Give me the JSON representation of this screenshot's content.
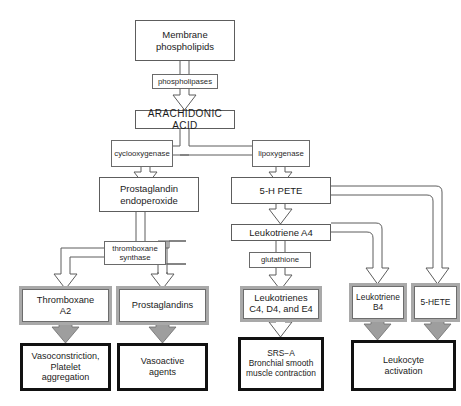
{
  "diagram": {
    "colors": {
      "line": "#5d5d5d",
      "gray_frame": "#a9a9a9",
      "gray_arrow_fill": "#9e9e9e",
      "heavy_border": "#111111",
      "text": "#1b1b1b",
      "background": "#ffffff"
    },
    "nodes": {
      "membrane_phospholipids": {
        "label": "Membrane\nphospholipids",
        "line1": "Membrane",
        "line2": "phospholipids",
        "style": "plain"
      },
      "phospholipases": {
        "label": "phospholipases",
        "style": "enzyme"
      },
      "arachidonic_acid": {
        "label": "ARACHIDONIC  ACID",
        "style": "plain"
      },
      "cyclooxygenase": {
        "label": "cyclooxygenase",
        "style": "enzyme"
      },
      "lipoxygenase": {
        "label": "lipoxygenase",
        "style": "enzyme"
      },
      "prostaglandin_endoperoxide": {
        "line1": "Prostaglandin",
        "line2": "endoperoxide",
        "style": "plain"
      },
      "five_h_pete": {
        "label": "5-H  PETE",
        "style": "plain"
      },
      "leukotriene_a4": {
        "label": "Leukotriene  A4",
        "style": "plain"
      },
      "thromboxane_synthase": {
        "line1": "thromboxane",
        "line2": "synthase",
        "style": "enzyme"
      },
      "glutathione": {
        "label": "glutathione",
        "style": "enzyme"
      },
      "thromboxane_a2": {
        "line1": "Thromboxane",
        "line2": "A2",
        "style": "gray"
      },
      "prostaglandins": {
        "label": "Prostaglandins",
        "style": "gray"
      },
      "leukotrienes_cde": {
        "line1": "Leukotrienes",
        "line2": "C4, D4, and E4",
        "style": "gray"
      },
      "leukotriene_b4": {
        "line1": "Leukotriene",
        "line2": "B4",
        "style": "gray"
      },
      "five_hete": {
        "label": "5-HETE",
        "style": "gray"
      },
      "vasoconstriction": {
        "line1": "Vasoconstriction,",
        "line2": "Platelet",
        "line3": "aggregation",
        "style": "heavy"
      },
      "vasoactive_agents": {
        "line1": "Vasoactive",
        "line2": "agents",
        "style": "heavy"
      },
      "srs_a": {
        "line1": "SRS−A",
        "line2": "Bronchial  smooth",
        "line3": "muscle  contraction",
        "style": "heavy"
      },
      "leukocyte_activation": {
        "line1": "Leukocyte",
        "line2": "activation",
        "style": "heavy"
      }
    }
  }
}
